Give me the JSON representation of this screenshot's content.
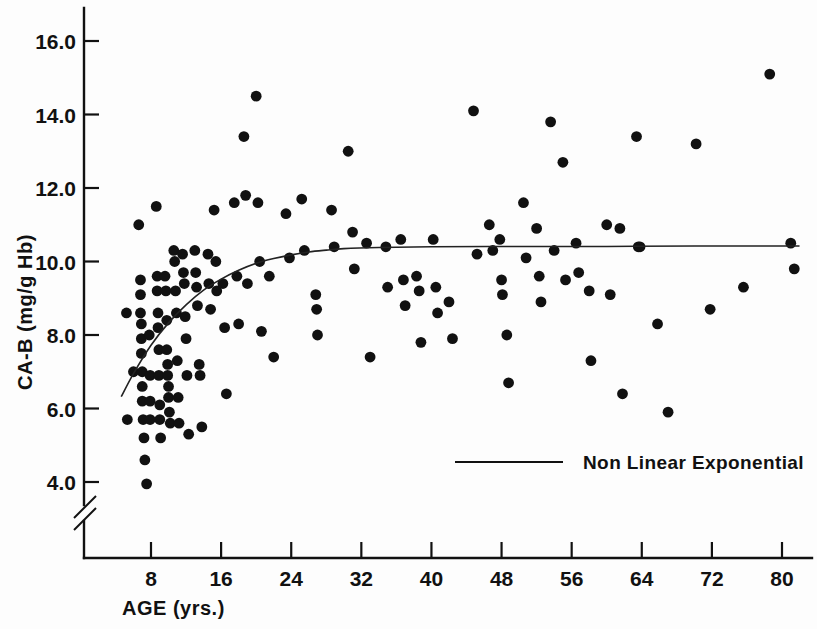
{
  "figure": {
    "background": "#fdfdfd",
    "ink_color": "#111111"
  },
  "chart_data": {
    "type": "scatter",
    "title": "",
    "subtitle": "",
    "xlabel": "AGE (yrs.)",
    "ylabel": "CA-B (mg/g Hb)",
    "xlim": [
      2,
      84
    ],
    "ylim": [
      3.2,
      16.9
    ],
    "xticks": [
      8,
      16,
      24,
      32,
      40,
      48,
      56,
      64,
      72,
      80
    ],
    "xtick_labels": [
      "8",
      "16",
      "24",
      "32",
      "40",
      "48",
      "56",
      "64",
      "72",
      "80"
    ],
    "yticks": [
      4.0,
      6.0,
      8.0,
      10.0,
      12.0,
      14.0,
      16.0
    ],
    "ytick_labels": [
      "4.0",
      "6.0",
      "8.0",
      "10.0",
      "12.0",
      "14.0",
      "16.0"
    ],
    "y_axis_break": true,
    "y_axis_break_note": "broken axis below 4.0",
    "grid": false,
    "legend_position": "inside-lower-right",
    "legend": [
      {
        "label": "Non Linear Exponential",
        "marker": "line",
        "color": "#111111"
      }
    ],
    "series": [
      {
        "name": "CA-B measurements",
        "marker": "filled-circle",
        "color": "#111111",
        "points": [
          [
            5.2,
            8.6
          ],
          [
            5.3,
            5.7
          ],
          [
            6.0,
            7.0
          ],
          [
            6.6,
            11.0
          ],
          [
            6.8,
            9.5
          ],
          [
            6.8,
            9.1
          ],
          [
            6.8,
            8.6
          ],
          [
            6.9,
            8.3
          ],
          [
            6.9,
            7.9
          ],
          [
            6.9,
            7.5
          ],
          [
            7.0,
            7.0
          ],
          [
            7.0,
            6.6
          ],
          [
            7.0,
            6.2
          ],
          [
            7.1,
            5.7
          ],
          [
            7.2,
            5.2
          ],
          [
            7.3,
            4.6
          ],
          [
            7.5,
            3.95
          ],
          [
            7.8,
            8.0
          ],
          [
            7.9,
            6.9
          ],
          [
            7.9,
            6.2
          ],
          [
            7.9,
            5.7
          ],
          [
            8.6,
            11.5
          ],
          [
            8.7,
            9.6
          ],
          [
            8.7,
            9.2
          ],
          [
            8.8,
            8.6
          ],
          [
            8.8,
            8.2
          ],
          [
            8.9,
            7.6
          ],
          [
            8.9,
            6.9
          ],
          [
            9.0,
            6.1
          ],
          [
            9.0,
            5.7
          ],
          [
            9.1,
            5.2
          ],
          [
            9.6,
            9.6
          ],
          [
            9.7,
            9.2
          ],
          [
            9.8,
            8.4
          ],
          [
            9.8,
            7.6
          ],
          [
            9.9,
            7.2
          ],
          [
            9.9,
            6.9
          ],
          [
            10.0,
            6.6
          ],
          [
            10.0,
            6.3
          ],
          [
            10.1,
            5.9
          ],
          [
            10.2,
            5.6
          ],
          [
            10.6,
            10.3
          ],
          [
            10.7,
            10.0
          ],
          [
            10.8,
            9.2
          ],
          [
            10.9,
            8.6
          ],
          [
            11.0,
            7.3
          ],
          [
            11.1,
            6.3
          ],
          [
            11.2,
            5.6
          ],
          [
            11.6,
            10.2
          ],
          [
            11.7,
            9.7
          ],
          [
            11.8,
            9.4
          ],
          [
            11.9,
            8.5
          ],
          [
            12.0,
            7.9
          ],
          [
            12.1,
            6.9
          ],
          [
            12.3,
            5.3
          ],
          [
            13.0,
            10.3
          ],
          [
            13.1,
            9.7
          ],
          [
            13.2,
            9.3
          ],
          [
            13.3,
            8.8
          ],
          [
            13.5,
            7.2
          ],
          [
            13.6,
            6.9
          ],
          [
            13.8,
            5.5
          ],
          [
            14.5,
            10.2
          ],
          [
            14.6,
            9.4
          ],
          [
            14.8,
            8.7
          ],
          [
            15.2,
            11.4
          ],
          [
            15.4,
            10.0
          ],
          [
            15.5,
            9.2
          ],
          [
            16.2,
            9.4
          ],
          [
            16.4,
            8.2
          ],
          [
            16.6,
            6.4
          ],
          [
            17.5,
            11.6
          ],
          [
            17.8,
            9.6
          ],
          [
            18.0,
            8.3
          ],
          [
            18.6,
            13.4
          ],
          [
            18.8,
            11.8
          ],
          [
            19.0,
            9.4
          ],
          [
            20.0,
            14.5
          ],
          [
            20.2,
            11.6
          ],
          [
            20.4,
            10.0
          ],
          [
            20.6,
            8.1
          ],
          [
            21.5,
            9.6
          ],
          [
            22.0,
            7.4
          ],
          [
            23.4,
            11.3
          ],
          [
            23.8,
            10.1
          ],
          [
            25.2,
            11.7
          ],
          [
            25.5,
            10.3
          ],
          [
            26.8,
            9.1
          ],
          [
            26.9,
            8.7
          ],
          [
            27.0,
            8.0
          ],
          [
            28.6,
            11.4
          ],
          [
            28.9,
            10.4
          ],
          [
            30.5,
            13.0
          ],
          [
            31.0,
            10.8
          ],
          [
            31.2,
            9.8
          ],
          [
            32.6,
            10.5
          ],
          [
            33.0,
            7.4
          ],
          [
            34.8,
            10.4
          ],
          [
            35.0,
            9.3
          ],
          [
            36.5,
            10.6
          ],
          [
            36.8,
            9.5
          ],
          [
            37.0,
            8.8
          ],
          [
            38.3,
            9.6
          ],
          [
            38.6,
            9.2
          ],
          [
            38.8,
            7.8
          ],
          [
            40.2,
            10.6
          ],
          [
            40.5,
            9.3
          ],
          [
            40.7,
            8.6
          ],
          [
            42.0,
            8.9
          ],
          [
            42.4,
            7.9
          ],
          [
            44.8,
            14.1
          ],
          [
            45.2,
            10.2
          ],
          [
            46.6,
            11.0
          ],
          [
            47.0,
            10.3
          ],
          [
            47.8,
            10.6
          ],
          [
            48.0,
            9.5
          ],
          [
            48.1,
            9.1
          ],
          [
            48.6,
            8.0
          ],
          [
            48.8,
            6.7
          ],
          [
            50.5,
            11.6
          ],
          [
            50.8,
            10.1
          ],
          [
            52.0,
            10.9
          ],
          [
            52.3,
            9.6
          ],
          [
            52.5,
            8.9
          ],
          [
            53.6,
            13.8
          ],
          [
            54.0,
            10.3
          ],
          [
            55.0,
            12.7
          ],
          [
            55.3,
            9.5
          ],
          [
            56.5,
            10.5
          ],
          [
            56.8,
            9.7
          ],
          [
            58.0,
            9.2
          ],
          [
            58.2,
            7.3
          ],
          [
            60.0,
            11.0
          ],
          [
            60.4,
            9.1
          ],
          [
            61.5,
            10.9
          ],
          [
            61.8,
            6.4
          ],
          [
            63.4,
            13.4
          ],
          [
            63.6,
            10.4
          ],
          [
            63.8,
            10.4
          ],
          [
            65.8,
            8.3
          ],
          [
            67.0,
            5.9
          ],
          [
            70.2,
            13.2
          ],
          [
            71.8,
            8.7
          ],
          [
            75.6,
            9.3
          ],
          [
            78.6,
            15.1
          ],
          [
            81.0,
            10.5
          ],
          [
            81.4,
            9.8
          ]
        ]
      }
    ],
    "fit_curve": {
      "name": "Non Linear Exponential",
      "model": "asymptotic exponential",
      "asymptote": 10.4,
      "points": [
        [
          4.6,
          6.32
        ],
        [
          6.0,
          6.95
        ],
        [
          8.0,
          7.72
        ],
        [
          10.0,
          8.33
        ],
        [
          12.0,
          8.82
        ],
        [
          14.0,
          9.22
        ],
        [
          16.0,
          9.52
        ],
        [
          18.0,
          9.76
        ],
        [
          20.0,
          9.95
        ],
        [
          22.0,
          10.08
        ],
        [
          24.0,
          10.18
        ],
        [
          26.0,
          10.26
        ],
        [
          28.0,
          10.31
        ],
        [
          30.0,
          10.35
        ],
        [
          34.0,
          10.38
        ],
        [
          40.0,
          10.4
        ],
        [
          50.0,
          10.41
        ],
        [
          60.0,
          10.41
        ],
        [
          70.0,
          10.42
        ],
        [
          82.0,
          10.42
        ]
      ]
    }
  }
}
